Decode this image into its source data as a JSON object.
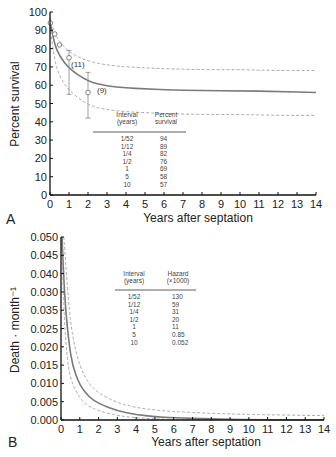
{
  "chart_data": [
    {
      "panel": "A",
      "type": "line",
      "xlabel": "Years after septation",
      "ylabel": "Percent survival",
      "xlim": [
        0,
        14
      ],
      "ylim": [
        0,
        100
      ],
      "xticks": [
        0,
        1,
        2,
        3,
        4,
        5,
        6,
        7,
        8,
        9,
        10,
        11,
        12,
        13,
        14
      ],
      "yticks": [
        0,
        10,
        20,
        30,
        40,
        50,
        60,
        70,
        80,
        90,
        100
      ],
      "series": [
        {
          "name": "Parametric survival estimate",
          "style": "solid",
          "x": [
            0,
            0.25,
            0.5,
            1,
            2,
            3,
            4,
            5,
            6,
            8,
            10,
            12,
            14
          ],
          "values": [
            95,
            82,
            76,
            69,
            62,
            59.5,
            58.5,
            58,
            57.5,
            57,
            57,
            56.5,
            56
          ]
        },
        {
          "name": "Upper confidence limit",
          "style": "dashed",
          "x": [
            0,
            0.25,
            0.5,
            1,
            2,
            3,
            4,
            5,
            6,
            8,
            10,
            12,
            14
          ],
          "values": [
            97,
            88,
            84,
            78,
            73,
            71,
            70,
            69.5,
            69,
            68.5,
            68.5,
            68,
            68
          ]
        },
        {
          "name": "Lower confidence limit",
          "style": "dashed",
          "x": [
            0,
            0.25,
            0.5,
            1,
            2,
            3,
            4,
            5,
            6,
            8,
            10,
            12,
            14
          ],
          "values": [
            92,
            73,
            65,
            57,
            49,
            46.5,
            45.5,
            45,
            44.5,
            44,
            44,
            43.5,
            43.5
          ]
        },
        {
          "name": "Kaplan-Meier estimates",
          "style": "open-circle",
          "x": [
            0.02,
            0.25,
            0.5,
            1,
            2
          ],
          "values": [
            94,
            88,
            82,
            75,
            56
          ],
          "error_bars": [
            null,
            null,
            null,
            [
              55,
              79
            ],
            [
              42,
              67
            ]
          ]
        }
      ],
      "annotations": [
        {
          "text": "(11)",
          "x": 1.2,
          "y": 70
        },
        {
          "text": "(9)",
          "x": 2.3,
          "y": 57
        }
      ],
      "table": {
        "headers": [
          "Interval (years)",
          "Percent survival"
        ],
        "rows": [
          [
            "1/52",
            "94"
          ],
          [
            "1/12",
            "89"
          ],
          [
            "1/4",
            "82"
          ],
          [
            "1/2",
            "76"
          ],
          [
            "1",
            "69"
          ],
          [
            "5",
            "58"
          ],
          [
            "10",
            "57"
          ]
        ]
      }
    },
    {
      "panel": "B",
      "type": "line",
      "xlabel": "Years after septation",
      "ylabel": "Death · month⁻¹",
      "xlim": [
        0,
        14
      ],
      "ylim": [
        0,
        0.05
      ],
      "xticks": [
        0,
        1,
        2,
        3,
        4,
        5,
        6,
        7,
        8,
        9,
        10,
        11,
        12,
        13,
        14
      ],
      "ytick_labels": [
        "0.000",
        "0.005",
        "0.010",
        "0.015",
        "0.020",
        "0.025",
        "0.035",
        "0.030",
        "0.040",
        "0.045",
        "0.050"
      ],
      "series": [
        {
          "name": "Hazard estimate",
          "style": "solid",
          "x": [
            0.05,
            0.2,
            0.4,
            0.6,
            1,
            1.5,
            2,
            3,
            4,
            5,
            6,
            8,
            10,
            14
          ],
          "values": [
            0.05,
            0.033,
            0.022,
            0.015,
            0.0095,
            0.0062,
            0.0045,
            0.0025,
            0.0015,
            0.0009,
            0.0006,
            0.0003,
            0.0001,
            5e-05
          ]
        },
        {
          "name": "Upper confidence limit",
          "style": "dashed",
          "x": [
            0.15,
            0.4,
            0.6,
            1,
            1.5,
            2,
            3,
            4,
            5,
            6,
            8,
            10,
            14
          ],
          "values": [
            0.05,
            0.032,
            0.023,
            0.0145,
            0.0098,
            0.0073,
            0.0047,
            0.0034,
            0.0027,
            0.0023,
            0.0018,
            0.0015,
            0.0012
          ]
        },
        {
          "name": "Lower confidence limit",
          "style": "dashed",
          "x": [
            0.03,
            0.15,
            0.3,
            0.5,
            1,
            1.5,
            2,
            3,
            4,
            5,
            6,
            8,
            14
          ],
          "values": [
            0.05,
            0.03,
            0.018,
            0.011,
            0.0058,
            0.0037,
            0.0025,
            0.0012,
            0.0006,
            0.0003,
            0.0002,
            0.0001,
            3e-05
          ]
        }
      ],
      "table": {
        "headers": [
          "Interval (years)",
          "Hazard (×1000)"
        ],
        "rows": [
          [
            "1/52",
            "130"
          ],
          [
            "1/12",
            "59"
          ],
          [
            "1/4",
            "31"
          ],
          [
            "1/2",
            "20"
          ],
          [
            "1",
            "11"
          ],
          [
            "5",
            "0.85"
          ],
          [
            "10",
            "0.052"
          ]
        ]
      }
    }
  ],
  "panels": {
    "a": {
      "label": "A",
      "xlabel": "Years after septation",
      "ylabel": "Percent survival",
      "xticks": [
        "0",
        "1",
        "2",
        "3",
        "4",
        "5",
        "6",
        "7",
        "8",
        "9",
        "10",
        "11",
        "12",
        "13",
        "14"
      ],
      "yticks": [
        "0",
        "10",
        "20",
        "30",
        "40",
        "50",
        "60",
        "70",
        "80",
        "90",
        "100"
      ],
      "annot_11": "(11)",
      "annot_9": "(9)",
      "table": {
        "h1a": "Interval",
        "h1b": "(years)",
        "h2a": "Percent",
        "h2b": "survival",
        "c1": [
          "1/52",
          "1/12",
          "1/4",
          "1/2",
          "1",
          "5",
          "10"
        ],
        "c2": [
          "94",
          "89",
          "82",
          "76",
          "69",
          "58",
          "57"
        ]
      }
    },
    "b": {
      "label": "B",
      "xlabel": "Years after septation",
      "ylabel": "Death · month⁻¹",
      "xticks": [
        "0",
        "1",
        "2",
        "3",
        "4",
        "5",
        "6",
        "7",
        "8",
        "9",
        "10",
        "11",
        "12",
        "13",
        "14"
      ],
      "yticks": [
        "0.000",
        "0.005",
        "0.010",
        "0.015",
        "0.020",
        "0.025",
        "0.035",
        "0.030",
        "0.040",
        "0.045",
        "0.050"
      ],
      "table": {
        "h1a": "Interval",
        "h1b": "(years)",
        "h2a": "Hazard",
        "h2b": "(×1000)",
        "c1": [
          "1/52",
          "1/12",
          "1/4",
          "1/2",
          "1",
          "5",
          "10"
        ],
        "c2": [
          "130",
          "59",
          "31",
          "20",
          "11",
          "0.85",
          "0.052"
        ]
      }
    }
  },
  "colors": {
    "estimate_line": "#7a7a7a",
    "ci_line": "#a0a0a0",
    "axis": "#111111"
  }
}
